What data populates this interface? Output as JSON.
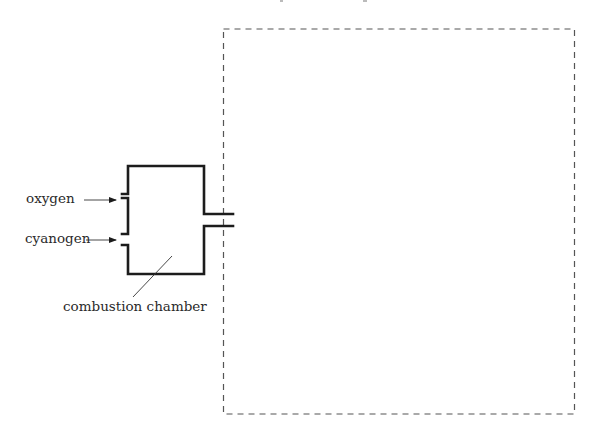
{
  "diagram": {
    "type": "apparatus-schematic",
    "labels": {
      "oxygen": "oxygen",
      "cyanogen": "cyanogen",
      "chamber": "combustion chamber"
    },
    "components": [
      {
        "name": "combustion-chamber",
        "shape": "rectangle with two inlets on left and outlet on right"
      },
      {
        "name": "enclosure",
        "shape": "dashed rectangle"
      }
    ],
    "colors": {
      "background": "#ffffff",
      "stroke": "#1c1c1c",
      "dashed": "#555555",
      "text": "#2a2a2a"
    }
  }
}
